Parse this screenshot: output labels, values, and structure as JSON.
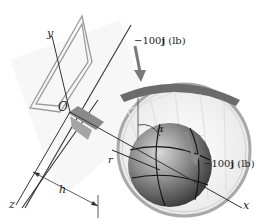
{
  "figure": {
    "axes": {
      "x": "x",
      "y": "y",
      "z": "z"
    },
    "origin": "O",
    "forces": [
      {
        "prefix": "−100",
        "vector": "j",
        "unit": " (lb)"
      },
      {
        "prefix": "−100",
        "vector": "j",
        "unit": " (lb)"
      }
    ],
    "dimensions": {
      "h": "h",
      "r": "r",
      "alpha": "α"
    }
  },
  "colors": {
    "line": "#333333",
    "force_arrow": "#7a7a7a",
    "rim": "#a8a8a8",
    "backboard_edge": "#9a9a9a",
    "ball_dark": "#2b2b2b",
    "ball_light": "#c8c8c8",
    "bracket": "#8a8a8a"
  }
}
